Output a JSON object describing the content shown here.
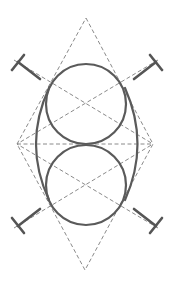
{
  "diagram": {
    "title": "Oval construction from two tangent circles within a rhombus",
    "colors": {
      "background": "#ffffff",
      "construction": "#8a8a8a",
      "curve": "#5a5a5a",
      "tmark": "#555555"
    },
    "rhombus": {
      "top": [
        86,
        18
      ],
      "right": [
        153,
        144
      ],
      "bottom": [
        85,
        270
      ],
      "left": [
        17,
        144
      ]
    },
    "horizontal_axis": {
      "from": [
        17,
        144
      ],
      "to": [
        153,
        144
      ]
    },
    "circles": [
      {
        "name": "upper-circle",
        "cx": 86,
        "cy": 104,
        "r": 40
      },
      {
        "name": "lower-circle",
        "cx": 86,
        "cy": 185,
        "r": 40
      }
    ],
    "diagonals": [
      {
        "name": "upper-diagonal-left",
        "from": [
          14,
          60
        ],
        "to": [
          153,
          144
        ]
      },
      {
        "name": "upper-diagonal-right",
        "from": [
          158,
          60
        ],
        "to": [
          17,
          144
        ]
      },
      {
        "name": "lower-diagonal-left",
        "from": [
          14,
          228
        ],
        "to": [
          153,
          144
        ]
      },
      {
        "name": "lower-diagonal-right",
        "from": [
          158,
          228
        ],
        "to": [
          17,
          144
        ]
      }
    ],
    "outer_arcs": [
      {
        "name": "left-outer-arc",
        "start": [
          49,
          88
        ],
        "control": [
          23,
          144
        ],
        "end": [
          49,
          200
        ]
      },
      {
        "name": "right-outer-arc",
        "start": [
          125,
          88
        ],
        "control": [
          150,
          144
        ],
        "end": [
          125,
          200
        ]
      }
    ],
    "t_marks": [
      {
        "name": "t-mark-top-left",
        "bar": [
          [
            12,
            70
          ],
          [
            24,
            55
          ]
        ],
        "stem": [
          [
            18,
            62
          ],
          [
            40,
            79
          ]
        ]
      },
      {
        "name": "t-mark-top-right",
        "bar": [
          [
            150,
            55
          ],
          [
            162,
            70
          ]
        ],
        "stem": [
          [
            156,
            62
          ],
          [
            134,
            79
          ]
        ]
      },
      {
        "name": "t-mark-bottom-left",
        "bar": [
          [
            12,
            218
          ],
          [
            24,
            233
          ]
        ],
        "stem": [
          [
            18,
            226
          ],
          [
            40,
            209
          ]
        ]
      },
      {
        "name": "t-mark-bottom-right",
        "bar": [
          [
            150,
            233
          ],
          [
            162,
            218
          ]
        ],
        "stem": [
          [
            156,
            226
          ],
          [
            134,
            209
          ]
        ]
      }
    ]
  }
}
